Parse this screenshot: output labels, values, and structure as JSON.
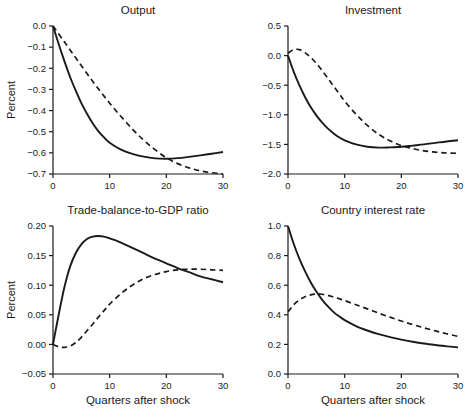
{
  "colors": {
    "ink": "#1a1a1a",
    "background": "#ffffff"
  },
  "chart_data": [
    {
      "type": "line",
      "title": "Output",
      "ylabel": "Percent",
      "xlabel": "",
      "xlim": [
        0,
        30
      ],
      "ylim": [
        -0.7,
        0.0
      ],
      "xticks": [
        0,
        10,
        20,
        30
      ],
      "xticklabels": [
        "0",
        "10",
        "20",
        "30"
      ],
      "yticks": [
        0.0,
        -0.1,
        -0.2,
        -0.3,
        -0.4,
        -0.5,
        -0.6,
        -0.7
      ],
      "yticklabels": [
        "0.0",
        "−0.1",
        "−0.2",
        "−0.3",
        "−0.4",
        "−0.5",
        "−0.6",
        "−0.7"
      ],
      "grid": false,
      "legend": "none",
      "series": [
        {
          "name": "solid",
          "style": "solid",
          "points": [
            [
              0,
              0
            ],
            [
              1,
              -0.085
            ],
            [
              2,
              -0.165
            ],
            [
              3,
              -0.24
            ],
            [
              4,
              -0.305
            ],
            [
              5,
              -0.365
            ],
            [
              6,
              -0.415
            ],
            [
              7,
              -0.46
            ],
            [
              8,
              -0.497
            ],
            [
              9,
              -0.527
            ],
            [
              10,
              -0.552
            ],
            [
              12,
              -0.585
            ],
            [
              14,
              -0.605
            ],
            [
              16,
              -0.618
            ],
            [
              18,
              -0.626
            ],
            [
              20,
              -0.628
            ],
            [
              22,
              -0.625
            ],
            [
              24,
              -0.619
            ],
            [
              26,
              -0.612
            ],
            [
              28,
              -0.604
            ],
            [
              30,
              -0.596
            ]
          ]
        },
        {
          "name": "dashed",
          "style": "dashed",
          "points": [
            [
              0,
              0
            ],
            [
              2,
              -0.075
            ],
            [
              4,
              -0.15
            ],
            [
              6,
              -0.225
            ],
            [
              8,
              -0.297
            ],
            [
              10,
              -0.365
            ],
            [
              12,
              -0.428
            ],
            [
              14,
              -0.487
            ],
            [
              16,
              -0.54
            ],
            [
              18,
              -0.585
            ],
            [
              20,
              -0.623
            ],
            [
              22,
              -0.651
            ],
            [
              24,
              -0.671
            ],
            [
              26,
              -0.685
            ],
            [
              28,
              -0.694
            ],
            [
              30,
              -0.7
            ]
          ]
        }
      ]
    },
    {
      "type": "line",
      "title": "Investment",
      "ylabel": "",
      "xlabel": "",
      "xlim": [
        0,
        30
      ],
      "ylim": [
        -2.0,
        0.5
      ],
      "xticks": [
        0,
        10,
        20,
        30
      ],
      "xticklabels": [
        "0",
        "10",
        "20",
        "30"
      ],
      "yticks": [
        0.5,
        0.0,
        -0.5,
        -1.0,
        -1.5,
        -2.0
      ],
      "yticklabels": [
        "0.5",
        "0.0",
        "−0.5",
        "−1.0",
        "−1.5",
        "−2.0"
      ],
      "grid": false,
      "legend": "none",
      "series": [
        {
          "name": "solid",
          "style": "solid",
          "points": [
            [
              0,
              0
            ],
            [
              1,
              -0.27
            ],
            [
              2,
              -0.5
            ],
            [
              3,
              -0.7
            ],
            [
              4,
              -0.87
            ],
            [
              5,
              -1.01
            ],
            [
              6,
              -1.13
            ],
            [
              7,
              -1.23
            ],
            [
              8,
              -1.31
            ],
            [
              9,
              -1.38
            ],
            [
              10,
              -1.43
            ],
            [
              12,
              -1.5
            ],
            [
              14,
              -1.54
            ],
            [
              16,
              -1.555
            ],
            [
              18,
              -1.55
            ],
            [
              20,
              -1.54
            ],
            [
              22,
              -1.52
            ],
            [
              24,
              -1.5
            ],
            [
              26,
              -1.475
            ],
            [
              28,
              -1.45
            ],
            [
              30,
              -1.43
            ]
          ]
        },
        {
          "name": "dashed",
          "style": "dashed",
          "points": [
            [
              0,
              0.04
            ],
            [
              1,
              0.1
            ],
            [
              2,
              0.1
            ],
            [
              3,
              0.05
            ],
            [
              4,
              -0.03
            ],
            [
              5,
              -0.13
            ],
            [
              6,
              -0.25
            ],
            [
              7,
              -0.38
            ],
            [
              8,
              -0.51
            ],
            [
              9,
              -0.64
            ],
            [
              10,
              -0.77
            ],
            [
              12,
              -0.99
            ],
            [
              14,
              -1.18
            ],
            [
              16,
              -1.33
            ],
            [
              18,
              -1.44
            ],
            [
              20,
              -1.52
            ],
            [
              22,
              -1.57
            ],
            [
              24,
              -1.61
            ],
            [
              26,
              -1.63
            ],
            [
              28,
              -1.645
            ],
            [
              30,
              -1.65
            ]
          ]
        }
      ]
    },
    {
      "type": "line",
      "title": "Trade-balance-to-GDP ratio",
      "ylabel": "Percent",
      "xlabel": "Quarters after shock",
      "xlim": [
        0,
        30
      ],
      "ylim": [
        -0.05,
        0.2
      ],
      "xticks": [
        0,
        10,
        20,
        30
      ],
      "xticklabels": [
        "0",
        "10",
        "20",
        "30"
      ],
      "yticks": [
        0.2,
        0.15,
        0.1,
        0.05,
        0.0,
        -0.05
      ],
      "yticklabels": [
        "0.20",
        "0.15",
        "0.10",
        "0.05",
        "0.00",
        "−0.05"
      ],
      "grid": false,
      "legend": "none",
      "series": [
        {
          "name": "solid",
          "style": "solid",
          "points": [
            [
              0,
              0
            ],
            [
              1,
              0.05
            ],
            [
              2,
              0.096
            ],
            [
              3,
              0.131
            ],
            [
              4,
              0.154
            ],
            [
              5,
              0.169
            ],
            [
              6,
              0.178
            ],
            [
              7,
              0.182
            ],
            [
              8,
              0.183
            ],
            [
              9,
              0.182
            ],
            [
              10,
              0.179
            ],
            [
              12,
              0.172
            ],
            [
              14,
              0.163
            ],
            [
              16,
              0.154
            ],
            [
              18,
              0.145
            ],
            [
              20,
              0.137
            ],
            [
              22,
              0.129
            ],
            [
              24,
              0.122
            ],
            [
              26,
              0.115
            ],
            [
              28,
              0.11
            ],
            [
              30,
              0.105
            ]
          ]
        },
        {
          "name": "dashed",
          "style": "dashed",
          "points": [
            [
              0,
              0
            ],
            [
              1,
              -0.004
            ],
            [
              2,
              -0.005
            ],
            [
              3,
              -0.003
            ],
            [
              4,
              0.003
            ],
            [
              5,
              0.012
            ],
            [
              6,
              0.023
            ],
            [
              7,
              0.034
            ],
            [
              8,
              0.046
            ],
            [
              9,
              0.057
            ],
            [
              10,
              0.068
            ],
            [
              12,
              0.086
            ],
            [
              14,
              0.1
            ],
            [
              16,
              0.111
            ],
            [
              18,
              0.118
            ],
            [
              20,
              0.123
            ],
            [
              22,
              0.126
            ],
            [
              24,
              0.127
            ],
            [
              26,
              0.127
            ],
            [
              28,
              0.126
            ],
            [
              30,
              0.125
            ]
          ]
        }
      ]
    },
    {
      "type": "line",
      "title": "Country interest rate",
      "ylabel": "",
      "xlabel": "Quarters after shock",
      "xlim": [
        0,
        30
      ],
      "ylim": [
        0.0,
        1.0
      ],
      "xticks": [
        0,
        10,
        20,
        30
      ],
      "xticklabels": [
        "0",
        "10",
        "20",
        "30"
      ],
      "yticks": [
        1.0,
        0.8,
        0.6,
        0.4,
        0.2,
        0.0
      ],
      "yticklabels": [
        "1.0",
        "0.8",
        "0.6",
        "0.4",
        "0.2",
        "0.0"
      ],
      "grid": false,
      "legend": "none",
      "series": [
        {
          "name": "solid",
          "style": "solid",
          "points": [
            [
              0,
              1.0
            ],
            [
              1,
              0.88
            ],
            [
              2,
              0.78
            ],
            [
              3,
              0.695
            ],
            [
              4,
              0.62
            ],
            [
              5,
              0.557
            ],
            [
              6,
              0.503
            ],
            [
              7,
              0.458
            ],
            [
              8,
              0.42
            ],
            [
              9,
              0.39
            ],
            [
              10,
              0.364
            ],
            [
              12,
              0.324
            ],
            [
              14,
              0.294
            ],
            [
              16,
              0.269
            ],
            [
              18,
              0.249
            ],
            [
              20,
              0.232
            ],
            [
              22,
              0.218
            ],
            [
              24,
              0.206
            ],
            [
              26,
              0.196
            ],
            [
              28,
              0.187
            ],
            [
              30,
              0.18
            ]
          ]
        },
        {
          "name": "dashed",
          "style": "dashed",
          "points": [
            [
              0,
              0.42
            ],
            [
              1,
              0.468
            ],
            [
              2,
              0.5
            ],
            [
              3,
              0.522
            ],
            [
              4,
              0.535
            ],
            [
              5,
              0.541
            ],
            [
              6,
              0.539
            ],
            [
              7,
              0.532
            ],
            [
              8,
              0.521
            ],
            [
              9,
              0.509
            ],
            [
              10,
              0.496
            ],
            [
              12,
              0.468
            ],
            [
              14,
              0.44
            ],
            [
              16,
              0.411
            ],
            [
              18,
              0.384
            ],
            [
              20,
              0.358
            ],
            [
              22,
              0.334
            ],
            [
              24,
              0.312
            ],
            [
              26,
              0.291
            ],
            [
              28,
              0.272
            ],
            [
              30,
              0.254
            ]
          ]
        }
      ]
    }
  ]
}
